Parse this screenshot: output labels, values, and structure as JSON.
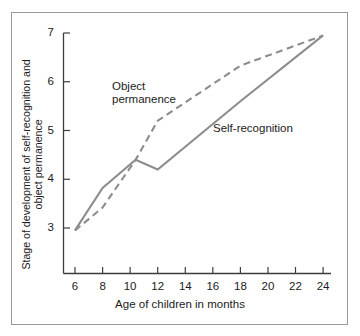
{
  "figure": {
    "border_color": "#9a9a9a",
    "background": "#ffffff"
  },
  "chart_data": {
    "type": "line",
    "title": "",
    "subtitle": "",
    "xlabel": "Age of children in months",
    "ylabel": "Stage of development of self-recognition and object permanence",
    "ylabel_line1": "Stage of development of self-recognition and",
    "ylabel_line2": "object permanence",
    "xlim": [
      5,
      25
    ],
    "ylim": [
      2.3,
      7
    ],
    "xticks": [
      6,
      8,
      10,
      12,
      14,
      16,
      18,
      20,
      22,
      24
    ],
    "xtick_labels": [
      "6",
      "8",
      "10",
      "12",
      "14",
      "16",
      "18",
      "20",
      "22",
      "24"
    ],
    "yticks": [
      3,
      4,
      5,
      6,
      7
    ],
    "ytick_labels": [
      "3",
      "4",
      "5",
      "6",
      "7"
    ],
    "grid": false,
    "legend_position": "inline-annotations",
    "line_color": "#8d8d8d",
    "series": [
      {
        "name": "Self-recognition",
        "style": "solid",
        "label_text": "Self-recognition",
        "x": [
          6,
          8,
          10.4,
          12,
          18,
          24
        ],
        "values": [
          2.95,
          3.82,
          4.4,
          4.2,
          5.6,
          6.95
        ]
      },
      {
        "name": "Object permanence",
        "style": "dashed",
        "label_text": "Object\npermanence",
        "x": [
          6,
          8,
          10.4,
          12,
          18,
          24
        ],
        "values": [
          2.95,
          3.42,
          4.4,
          5.2,
          6.33,
          6.95
        ]
      }
    ]
  },
  "annotations": {
    "object_permanence_label": "Object\npermanence",
    "self_recognition_label": "Self-recognition"
  }
}
